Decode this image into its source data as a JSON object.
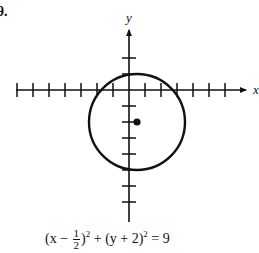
{
  "problem": {
    "number_label": "9."
  },
  "axes": {
    "x_label": "x",
    "y_label": "y",
    "origin_px": [
      129,
      90
    ],
    "unit_px": 16,
    "x_ticks": [
      -7,
      -6,
      -5,
      -4,
      -3,
      -2,
      -1,
      1,
      2,
      3,
      4,
      5,
      6
    ],
    "y_ticks": [
      2,
      1,
      -1,
      -2,
      -3,
      -4,
      -5,
      -6,
      -7
    ]
  },
  "circle": {
    "center": [
      0.5,
      -2
    ],
    "radius": 3,
    "center_marked": true
  },
  "equation": {
    "text": "(x − 1/2)² + (y + 2)² = 9",
    "part1": "(x − ",
    "frac_num": "1",
    "frac_den": "2",
    "part2": ")",
    "exp1": "2",
    "part3": " + (y + 2)",
    "exp2": "2",
    "part4": " = 9"
  }
}
